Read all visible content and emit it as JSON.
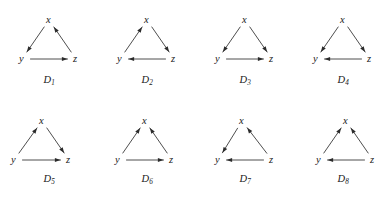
{
  "figure": {
    "vertex_names": [
      "x",
      "y",
      "z"
    ],
    "edge_color": "#3a3a3a",
    "arrow_color": "#2b2b2b",
    "background": "#ffffff",
    "rows": 2,
    "columns": 4
  },
  "digraphs": [
    {
      "id": "D1",
      "name_letter": "D",
      "name_subscript": "1",
      "shape": "equilateral",
      "vertices": {
        "x": {
          "label": "x",
          "cx": 49,
          "cy": 16
        },
        "y": {
          "label": "y",
          "cx": 22,
          "cy": 55
        },
        "z": {
          "label": "z",
          "cx": 76,
          "cy": 55
        }
      },
      "edges": [
        {
          "from": "x",
          "to": "y"
        },
        {
          "from": "y",
          "to": "z"
        },
        {
          "from": "z",
          "to": "x"
        }
      ]
    },
    {
      "id": "D2",
      "name_letter": "D",
      "name_subscript": "2",
      "shape": "equilateral",
      "vertices": {
        "x": {
          "label": "x",
          "cx": 49,
          "cy": 16
        },
        "y": {
          "label": "y",
          "cx": 22,
          "cy": 55
        },
        "z": {
          "label": "z",
          "cx": 76,
          "cy": 55
        }
      },
      "edges": [
        {
          "from": "y",
          "to": "x"
        },
        {
          "from": "x",
          "to": "z"
        },
        {
          "from": "z",
          "to": "y"
        }
      ]
    },
    {
      "id": "D3",
      "name_letter": "D",
      "name_subscript": "3",
      "shape": "equilateral",
      "vertices": {
        "x": {
          "label": "x",
          "cx": 49,
          "cy": 16
        },
        "y": {
          "label": "y",
          "cx": 22,
          "cy": 55
        },
        "z": {
          "label": "z",
          "cx": 76,
          "cy": 55
        }
      },
      "edges": [
        {
          "from": "x",
          "to": "y"
        },
        {
          "from": "x",
          "to": "z"
        },
        {
          "from": "y",
          "to": "z"
        }
      ]
    },
    {
      "id": "D4",
      "name_letter": "D",
      "name_subscript": "4",
      "shape": "equilateral",
      "vertices": {
        "x": {
          "label": "x",
          "cx": 49,
          "cy": 16
        },
        "y": {
          "label": "y",
          "cx": 22,
          "cy": 55
        },
        "z": {
          "label": "z",
          "cx": 76,
          "cy": 55
        }
      },
      "edges": [
        {
          "from": "x",
          "to": "y"
        },
        {
          "from": "x",
          "to": "z"
        },
        {
          "from": "z",
          "to": "y"
        }
      ]
    },
    {
      "id": "D5",
      "name_letter": "D",
      "name_subscript": "5",
      "shape": "skewed-left",
      "vertices": {
        "x": {
          "label": "x",
          "cx": 42,
          "cy": 18
        },
        "y": {
          "label": "y",
          "cx": 14,
          "cy": 57
        },
        "z": {
          "label": "z",
          "cx": 69,
          "cy": 57
        }
      },
      "edges": [
        {
          "from": "y",
          "to": "x"
        },
        {
          "from": "x",
          "to": "z"
        },
        {
          "from": "y",
          "to": "z"
        }
      ]
    },
    {
      "id": "D6",
      "name_letter": "D",
      "name_subscript": "6",
      "shape": "skewed-left",
      "vertices": {
        "x": {
          "label": "x",
          "cx": 47,
          "cy": 18
        },
        "y": {
          "label": "y",
          "cx": 20,
          "cy": 57
        },
        "z": {
          "label": "z",
          "cx": 74,
          "cy": 57
        }
      },
      "edges": [
        {
          "from": "y",
          "to": "x"
        },
        {
          "from": "z",
          "to": "x"
        },
        {
          "from": "y",
          "to": "z"
        }
      ]
    },
    {
      "id": "D7",
      "name_letter": "D",
      "name_subscript": "7",
      "shape": "skewed-right",
      "vertices": {
        "x": {
          "label": "x",
          "cx": 46,
          "cy": 18
        },
        "y": {
          "label": "y",
          "cx": 22,
          "cy": 57
        },
        "z": {
          "label": "z",
          "cx": 76,
          "cy": 57
        }
      },
      "edges": [
        {
          "from": "x",
          "to": "y"
        },
        {
          "from": "z",
          "to": "x"
        },
        {
          "from": "z",
          "to": "y"
        }
      ]
    },
    {
      "id": "D8",
      "name_letter": "D",
      "name_subscript": "8",
      "shape": "skewed-right",
      "vertices": {
        "x": {
          "label": "x",
          "cx": 52,
          "cy": 18
        },
        "y": {
          "label": "y",
          "cx": 25,
          "cy": 57
        },
        "z": {
          "label": "z",
          "cx": 79,
          "cy": 57
        }
      },
      "edges": [
        {
          "from": "y",
          "to": "x"
        },
        {
          "from": "z",
          "to": "x"
        },
        {
          "from": "z",
          "to": "y"
        }
      ]
    }
  ]
}
